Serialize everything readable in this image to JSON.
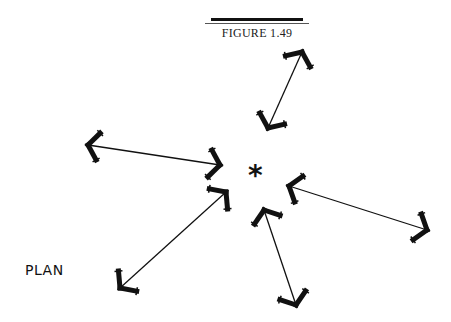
{
  "figure": {
    "title": "FIGURE 1.49",
    "label": "PLAN",
    "center_marker": "*"
  },
  "arrows": [
    {
      "name": "arrow-top",
      "x1": 302,
      "y1": 52,
      "x2": 268,
      "y2": 128
    },
    {
      "name": "arrow-left",
      "x1": 88,
      "y1": 145,
      "x2": 220,
      "y2": 165
    },
    {
      "name": "arrow-lower-left",
      "x1": 226,
      "y1": 192,
      "x2": 120,
      "y2": 288
    },
    {
      "name": "arrow-right",
      "x1": 289,
      "y1": 186,
      "x2": 427,
      "y2": 230
    },
    {
      "name": "arrow-bottom",
      "x1": 264,
      "y1": 210,
      "x2": 296,
      "y2": 305
    }
  ],
  "colors": {
    "ink": "#111111",
    "background": "#ffffff"
  }
}
